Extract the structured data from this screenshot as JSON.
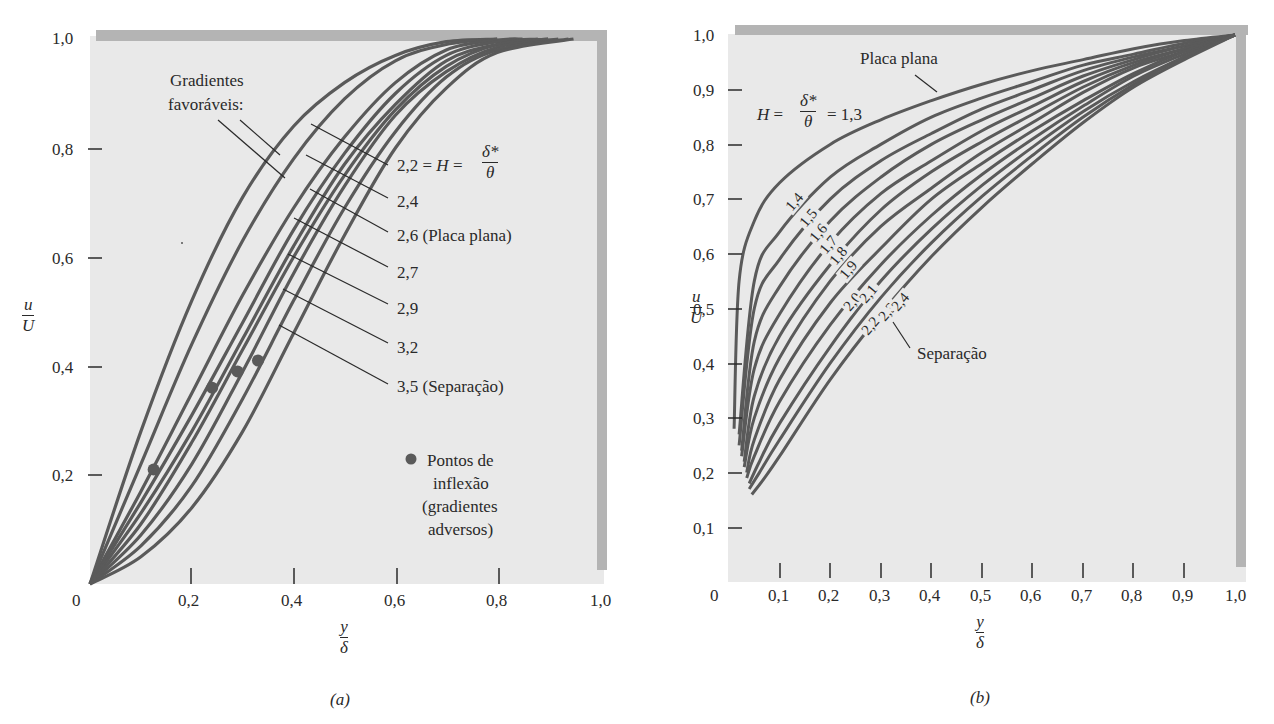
{
  "chart_data": [
    {
      "id": "a",
      "type": "line",
      "caption": "(a)",
      "xlabel": {
        "num": "y",
        "den": "δ"
      },
      "ylabel": {
        "num": "u",
        "den": "U"
      },
      "xlim": [
        0,
        1.0
      ],
      "ylim": [
        0,
        1.0
      ],
      "xticks": [
        0.2,
        0.4,
        0.6,
        0.8
      ],
      "xtick_labels": [
        "0",
        "0,2",
        "0,4",
        "0,6",
        "0,8",
        "1,0"
      ],
      "yticks": [
        0.2,
        0.4,
        0.6,
        0.8
      ],
      "ytick_labels": [
        "0,2",
        "0,4",
        "0,6",
        "0,8",
        "1,0"
      ],
      "grid": false,
      "annotation_favorable": [
        "Gradientes",
        "favoráveis:"
      ],
      "series_labels": [
        "2,2 = H = δ*/θ",
        "2,4",
        "2,6 (Placa plana)",
        "2,7",
        "2,9",
        "3,2",
        "3,5 (Separação)"
      ],
      "series": [
        {
          "name": "favorable-1",
          "H": null,
          "x": [
            0,
            0.1,
            0.2,
            0.3,
            0.4,
            0.5,
            0.6,
            0.7,
            0.8
          ],
          "y": [
            0,
            0.28,
            0.52,
            0.71,
            0.84,
            0.92,
            0.97,
            0.995,
            1.0
          ]
        },
        {
          "name": "favorable-2",
          "H": null,
          "x": [
            0,
            0.1,
            0.2,
            0.3,
            0.4,
            0.5,
            0.6,
            0.7,
            0.8
          ],
          "y": [
            0,
            0.22,
            0.44,
            0.63,
            0.78,
            0.89,
            0.96,
            0.99,
            1.0
          ]
        },
        {
          "name": "2,2",
          "H": 2.2,
          "x": [
            0,
            0.1,
            0.2,
            0.3,
            0.4,
            0.5,
            0.6,
            0.7,
            0.8,
            0.85
          ],
          "y": [
            0,
            0.17,
            0.35,
            0.53,
            0.69,
            0.82,
            0.92,
            0.98,
            0.998,
            1.0
          ]
        },
        {
          "name": "2,4",
          "H": 2.4,
          "x": [
            0,
            0.1,
            0.2,
            0.3,
            0.4,
            0.5,
            0.6,
            0.7,
            0.8,
            0.88
          ],
          "y": [
            0,
            0.15,
            0.31,
            0.48,
            0.65,
            0.79,
            0.9,
            0.97,
            0.995,
            1.0
          ]
        },
        {
          "name": "2,6 (Placa plana)",
          "H": 2.6,
          "x": [
            0,
            0.1,
            0.2,
            0.3,
            0.4,
            0.5,
            0.6,
            0.7,
            0.8,
            0.9
          ],
          "y": [
            0,
            0.13,
            0.28,
            0.45,
            0.62,
            0.77,
            0.88,
            0.96,
            0.99,
            1.0
          ]
        },
        {
          "name": "2,7",
          "H": 2.7,
          "x": [
            0,
            0.1,
            0.2,
            0.3,
            0.4,
            0.5,
            0.6,
            0.7,
            0.8,
            0.9
          ],
          "y": [
            0,
            0.11,
            0.26,
            0.43,
            0.6,
            0.75,
            0.87,
            0.95,
            0.99,
            1.0
          ]
        },
        {
          "name": "2,9",
          "H": 2.9,
          "x": [
            0,
            0.1,
            0.2,
            0.3,
            0.4,
            0.5,
            0.6,
            0.7,
            0.8,
            0.92
          ],
          "y": [
            0,
            0.09,
            0.22,
            0.39,
            0.57,
            0.73,
            0.86,
            0.94,
            0.985,
            1.0
          ]
        },
        {
          "name": "3,2",
          "H": 3.2,
          "x": [
            0,
            0.1,
            0.2,
            0.3,
            0.4,
            0.5,
            0.6,
            0.7,
            0.8,
            0.94
          ],
          "y": [
            0,
            0.07,
            0.18,
            0.34,
            0.52,
            0.69,
            0.83,
            0.93,
            0.98,
            1.0
          ]
        },
        {
          "name": "3,5 (Separação)",
          "H": 3.5,
          "x": [
            0,
            0.1,
            0.2,
            0.3,
            0.4,
            0.5,
            0.6,
            0.7,
            0.8,
            0.95
          ],
          "y": [
            0,
            0.05,
            0.14,
            0.28,
            0.46,
            0.64,
            0.8,
            0.91,
            0.975,
            1.0
          ]
        }
      ],
      "inflection_points": [
        {
          "x": 0.125,
          "y": 0.21
        },
        {
          "x": 0.24,
          "y": 0.36
        },
        {
          "x": 0.29,
          "y": 0.39
        },
        {
          "x": 0.33,
          "y": 0.41
        }
      ],
      "inflection_legend": [
        "Pontos de",
        "inflexão",
        "(gradientes",
        "adversos)"
      ]
    },
    {
      "id": "b",
      "type": "line",
      "caption": "(b)",
      "xlabel": {
        "num": "y",
        "den": "δ"
      },
      "ylabel": {
        "num": "u",
        "den": "U"
      },
      "xlim": [
        0,
        1.0
      ],
      "ylim": [
        0,
        1.0
      ],
      "xticks": [
        0.1,
        0.2,
        0.3,
        0.4,
        0.5,
        0.6,
        0.7,
        0.8,
        0.9
      ],
      "xtick_labels": [
        "0",
        "0,1",
        "0,2",
        "0,3",
        "0,4",
        "0,5",
        "0,6",
        "0,7",
        "0,8",
        "0,9",
        "1,0"
      ],
      "yticks": [
        0.1,
        0.2,
        0.3,
        0.4,
        0.5,
        0.6,
        0.7,
        0.8,
        0.9
      ],
      "ytick_labels": [
        "0,1",
        "0,2",
        "0,3",
        "0,4",
        "0,5",
        "0,6",
        "0,7",
        "0,8",
        "0,9",
        "1,0"
      ],
      "grid": false,
      "annotation_flat_plate": "Placa plana",
      "annotation_H": {
        "prefix": "H =",
        "num": "δ*",
        "den": "θ",
        "suffix": "= 1,3"
      },
      "annotation_separation": "Separação",
      "series": [
        {
          "name": "1,3",
          "H": 1.3,
          "start_y": 0.28,
          "mid_y_at_0.2": 0.8,
          "x": [
            0.01,
            0.02,
            0.05,
            0.1,
            0.2,
            0.3,
            0.4,
            0.5,
            0.6,
            0.7,
            0.8,
            0.9,
            1.0
          ],
          "y": [
            0.28,
            0.55,
            0.66,
            0.73,
            0.8,
            0.845,
            0.88,
            0.91,
            0.935,
            0.955,
            0.975,
            0.99,
            1.0
          ]
        },
        {
          "name": "1,4",
          "H": 1.4,
          "x": [
            0.02,
            0.05,
            0.1,
            0.2,
            0.3,
            0.4,
            0.5,
            0.6,
            0.7,
            0.8,
            0.9,
            1.0
          ],
          "y": [
            0.27,
            0.55,
            0.64,
            0.74,
            0.8,
            0.85,
            0.885,
            0.915,
            0.945,
            0.965,
            0.985,
            1.0
          ]
        },
        {
          "name": "1,5",
          "H": 1.5,
          "x": [
            0.02,
            0.05,
            0.1,
            0.2,
            0.3,
            0.4,
            0.5,
            0.6,
            0.7,
            0.8,
            0.9,
            1.0
          ],
          "y": [
            0.25,
            0.5,
            0.59,
            0.7,
            0.77,
            0.82,
            0.865,
            0.9,
            0.935,
            0.96,
            0.98,
            1.0
          ]
        },
        {
          "name": "1,6",
          "H": 1.6,
          "x": [
            0.025,
            0.05,
            0.1,
            0.2,
            0.3,
            0.4,
            0.5,
            0.6,
            0.7,
            0.8,
            0.9,
            1.0
          ],
          "y": [
            0.24,
            0.44,
            0.54,
            0.66,
            0.74,
            0.8,
            0.845,
            0.885,
            0.925,
            0.955,
            0.98,
            1.0
          ]
        },
        {
          "name": "1,7",
          "H": 1.7,
          "x": [
            0.025,
            0.05,
            0.1,
            0.2,
            0.3,
            0.4,
            0.5,
            0.6,
            0.7,
            0.8,
            0.9,
            1.0
          ],
          "y": [
            0.23,
            0.39,
            0.49,
            0.62,
            0.71,
            0.77,
            0.825,
            0.87,
            0.915,
            0.95,
            0.975,
            1.0
          ]
        },
        {
          "name": "1,8",
          "H": 1.8,
          "x": [
            0.03,
            0.05,
            0.1,
            0.2,
            0.3,
            0.4,
            0.5,
            0.6,
            0.7,
            0.8,
            0.9,
            1.0
          ],
          "y": [
            0.22,
            0.34,
            0.45,
            0.58,
            0.68,
            0.75,
            0.805,
            0.855,
            0.905,
            0.945,
            0.975,
            1.0
          ]
        },
        {
          "name": "1,9",
          "H": 1.9,
          "x": [
            0.03,
            0.05,
            0.1,
            0.2,
            0.3,
            0.4,
            0.5,
            0.6,
            0.7,
            0.8,
            0.9,
            1.0
          ],
          "y": [
            0.21,
            0.3,
            0.41,
            0.55,
            0.65,
            0.72,
            0.785,
            0.84,
            0.895,
            0.94,
            0.97,
            1.0
          ]
        },
        {
          "name": "2,0",
          "H": 2.0,
          "x": [
            0.035,
            0.05,
            0.1,
            0.2,
            0.3,
            0.4,
            0.5,
            0.6,
            0.7,
            0.8,
            0.9,
            1.0
          ],
          "y": [
            0.2,
            0.26,
            0.37,
            0.51,
            0.61,
            0.7,
            0.765,
            0.825,
            0.88,
            0.93,
            0.97,
            1.0
          ]
        },
        {
          "name": "2,1",
          "H": 2.1,
          "x": [
            0.035,
            0.05,
            0.1,
            0.2,
            0.3,
            0.4,
            0.5,
            0.6,
            0.7,
            0.8,
            0.9,
            1.0
          ],
          "y": [
            0.19,
            0.23,
            0.33,
            0.47,
            0.58,
            0.67,
            0.745,
            0.81,
            0.87,
            0.925,
            0.965,
            1.0
          ]
        },
        {
          "name": "2,2",
          "H": 2.2,
          "x": [
            0.04,
            0.06,
            0.1,
            0.2,
            0.3,
            0.4,
            0.5,
            0.6,
            0.7,
            0.8,
            0.9,
            1.0
          ],
          "y": [
            0.18,
            0.22,
            0.29,
            0.43,
            0.55,
            0.645,
            0.725,
            0.795,
            0.86,
            0.915,
            0.96,
            1.0
          ]
        },
        {
          "name": "2,3",
          "H": 2.3,
          "x": [
            0.04,
            0.06,
            0.1,
            0.2,
            0.3,
            0.4,
            0.5,
            0.6,
            0.7,
            0.8,
            0.9,
            1.0
          ],
          "y": [
            0.17,
            0.2,
            0.26,
            0.4,
            0.52,
            0.62,
            0.705,
            0.78,
            0.85,
            0.91,
            0.96,
            1.0
          ]
        },
        {
          "name": "2,4 (Separação)",
          "H": 2.4,
          "x": [
            0.045,
            0.07,
            0.1,
            0.2,
            0.3,
            0.4,
            0.5,
            0.6,
            0.7,
            0.8,
            0.9,
            1.0
          ],
          "y": [
            0.16,
            0.19,
            0.23,
            0.37,
            0.49,
            0.595,
            0.685,
            0.765,
            0.84,
            0.905,
            0.955,
            1.0
          ]
        }
      ],
      "curve_labels": [
        "1,4",
        "1,5",
        "1,6",
        "1,7",
        "1,8",
        "1,9",
        "2,0",
        "2,1",
        "2,2",
        "2,3",
        "2,4"
      ]
    }
  ],
  "a": {
    "caption": "(a)",
    "x_num": "y",
    "x_den": "δ",
    "y_num": "u",
    "y_den": "U",
    "ytick_labels": [
      "1,0",
      "0,8",
      "0,6",
      "0,4",
      "0,2"
    ],
    "xtick_labels": [
      "0",
      "0,2",
      "0,4",
      "0,6",
      "0,8",
      "1,0"
    ],
    "fav_1": "Gradientes",
    "fav_2": "favoráveis:",
    "lab_22_prefix": "2,2 = ",
    "lab_22_H": "H",
    "lab_22_eq": " = ",
    "lab_22_num": "δ*",
    "lab_22_den": "θ",
    "lab_24": "2,4",
    "lab_26": "2,6 (Placa plana)",
    "lab_27": "2,7",
    "lab_29": "2,9",
    "lab_32": "3,2",
    "lab_35": "3,5 (Separação)",
    "legend_1": "Pontos de",
    "legend_2": "inflexão",
    "legend_3": "(gradientes",
    "legend_4": "adversos)"
  },
  "b": {
    "caption": "(b)",
    "x_num": "y",
    "x_den": "δ",
    "y_num": "u",
    "y_den": "U",
    "ytick_labels": [
      "1,0",
      "0,9",
      "0,8",
      "0,7",
      "0,6",
      "0,5",
      "0,4",
      "0,3",
      "0,2",
      "0,1"
    ],
    "xtick_labels": [
      "0",
      "0,1",
      "0,2",
      "0,3",
      "0,4",
      "0,5",
      "0,6",
      "0,7",
      "0,8",
      "0,9",
      "1,0"
    ],
    "flat_plate": "Placa plana",
    "H_prefix": "H",
    "H_eq": " = ",
    "H_num": "δ*",
    "H_den": "θ",
    "H_suffix": " = 1,3",
    "separation": "Separação",
    "curve_labels": [
      "1,4",
      "1,5",
      "1,6",
      "1,7",
      "1,8",
      "1,9",
      "2,0",
      "2,1",
      "2,2",
      "2,3",
      "2,4"
    ]
  },
  "colors": {
    "curve": "#5a5a5a",
    "plot_bg": "#e9e9e9",
    "frame": "#b4b4b4",
    "text": "#2a2a2a",
    "dot": "#5a5a5a"
  }
}
